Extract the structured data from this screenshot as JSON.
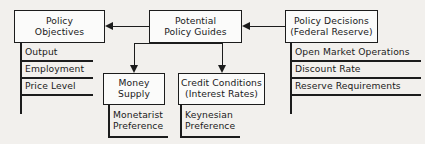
{
  "diagram": {
    "background_color": "#f2f0ed",
    "line_color": "#1c1c1c",
    "box_fill_color": "#fbfbfa",
    "boxes": {
      "policy_objectives": {
        "line1": "Policy",
        "line2": "Objectives"
      },
      "potential_policy_guides": {
        "line1": "Potential",
        "line2": "Policy Guides"
      },
      "policy_decisions": {
        "line1": "Policy Decisions",
        "line2": "(Federal Reserve)"
      },
      "money_supply": {
        "line1": "Money",
        "line2": "Supply"
      },
      "credit_conditions": {
        "line1": "Credit Conditions",
        "line2": "(Interest Rates)"
      }
    },
    "objective_items": [
      {
        "label": "Output"
      },
      {
        "label": "Employment"
      },
      {
        "label": "Price Level"
      }
    ],
    "decision_items": [
      {
        "label": "Open Market Operations"
      },
      {
        "label": "Discount Rate"
      },
      {
        "label": "Reserve Requirements"
      }
    ],
    "preferences": {
      "monetarist": {
        "line1": "Monetarist",
        "line2": "Preference"
      },
      "keynesian": {
        "line1": "Keynesian",
        "line2": "Preference"
      }
    }
  }
}
